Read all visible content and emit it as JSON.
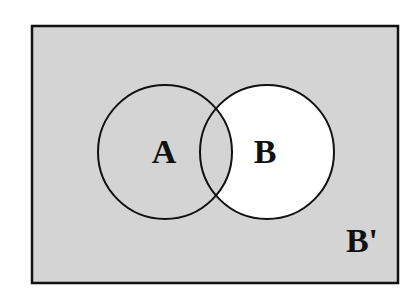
{
  "diagram": {
    "type": "venn",
    "universe_label": "B'",
    "sets": [
      {
        "label": "A"
      },
      {
        "label": "B"
      }
    ],
    "shaded_regions": [
      "A only",
      "A ∩ B",
      "outside A and B"
    ],
    "unshaded_regions": [
      "B only"
    ],
    "colors": {
      "shade": "#d4d4d4",
      "unshaded": "#ffffff",
      "stroke": "#111111"
    }
  }
}
